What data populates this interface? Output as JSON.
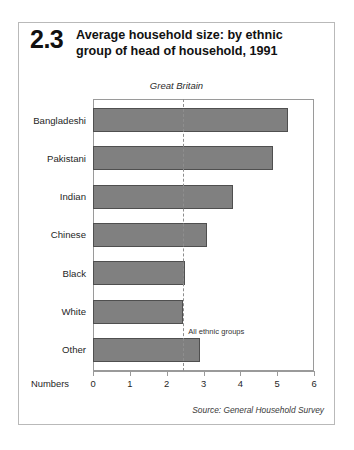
{
  "figure": {
    "number": "2.3",
    "title_line1": "Average household size: by ethnic",
    "title_line2": "group of head of household, 1991",
    "subtitle": "Great Britain",
    "source": "Source: General Household Survey"
  },
  "chart_data": {
    "type": "bar",
    "orientation": "horizontal",
    "title": "Average household size: by ethnic group of head of household, 1991",
    "subtitle": "Great Britain",
    "categories": [
      "Bangladeshi",
      "Pakistani",
      "Indian",
      "Chinese",
      "Black",
      "White",
      "Other"
    ],
    "values": [
      5.3,
      4.9,
      3.8,
      3.1,
      2.5,
      2.45,
      2.9
    ],
    "xlabel": "Numbers",
    "ylabel": "",
    "xlim": [
      0,
      6
    ],
    "xticks": [
      0,
      1,
      2,
      3,
      4,
      5,
      6
    ],
    "xtick_labels": [
      "0",
      "1",
      "2",
      "3",
      "4",
      "5",
      "6"
    ],
    "grid": false,
    "legend": false,
    "bar_color": "#808080",
    "bar_border_color": "#4f4f4f",
    "annotations": [
      {
        "label": "All ethnic groups",
        "value": 2.45,
        "type": "reference-line",
        "style": "dashed",
        "color": "#8e8e8e"
      }
    ],
    "source": "Source: General Household Survey"
  }
}
